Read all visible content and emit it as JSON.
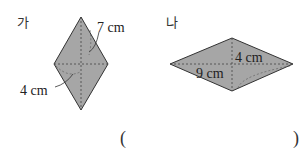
{
  "problem": {
    "figures": [
      {
        "label": "가",
        "shape": "rhombus",
        "measurements": [
          {
            "text": "7 cm",
            "refers_to": "half of long diagonal"
          },
          {
            "text": "4 cm",
            "refers_to": "half of short diagonal"
          }
        ]
      },
      {
        "label": "나",
        "shape": "rhombus",
        "measurements": [
          {
            "text": "4 cm",
            "refers_to": "half of short diagonal"
          },
          {
            "text": "9 cm",
            "refers_to": "half of long diagonal"
          }
        ]
      }
    ],
    "answer_blank": {
      "open": "(",
      "close": ")"
    }
  },
  "colors": {
    "fill": "#a6a6a6",
    "stroke": "#333333"
  }
}
